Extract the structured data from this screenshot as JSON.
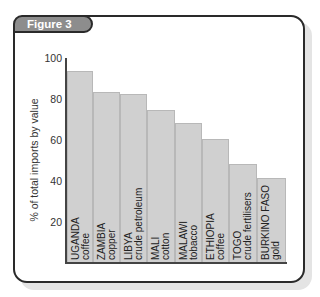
{
  "figure": {
    "label": "Figure 3"
  },
  "chart_data": {
    "type": "bar",
    "title": "Figure 3",
    "xlabel": "",
    "ylabel": "% of total imports by value",
    "ylim": [
      0,
      100
    ],
    "yticks": [
      20,
      40,
      60,
      80,
      100
    ],
    "grid": false,
    "legend": null,
    "categories": [
      "UGANDA coffee",
      "ZAMBIA copper",
      "LIBYA crude petroleum",
      "MALI cotton",
      "MALAWI tobacco",
      "ETHIOPIA coffee",
      "TOGO crude fertilisers",
      "BURKINO FASO gold"
    ],
    "values": [
      93,
      83,
      82,
      74,
      68,
      60,
      48,
      41
    ]
  },
  "bars": [
    {
      "country": "UGANDA",
      "product": "coffee",
      "value": 93
    },
    {
      "country": "ZAMBIA",
      "product": "copper",
      "value": 83
    },
    {
      "country": "LIBYA",
      "product": "crude petroleum",
      "value": 82
    },
    {
      "country": "MALI",
      "product": "cotton",
      "value": 74
    },
    {
      "country": "MALAWI",
      "product": "tobacco",
      "value": 68
    },
    {
      "country": "ETHIOPIA",
      "product": "coffee",
      "value": 60
    },
    {
      "country": "TOGO",
      "product": "crude fertilisers",
      "value": 48
    },
    {
      "country": "BURKINO FASO",
      "product": "gold",
      "value": 41
    }
  ],
  "axis": {
    "ylabel": "% of total imports by value",
    "ticks": [
      "100",
      "80",
      "60",
      "40",
      "20"
    ]
  }
}
